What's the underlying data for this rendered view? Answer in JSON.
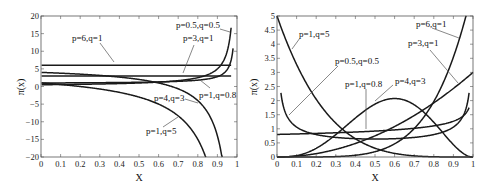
{
  "chart_data": [
    {
      "type": "line",
      "title": "",
      "xlabel": "X",
      "ylabel": "π(x)",
      "xlim": [
        0,
        1
      ],
      "ylim": [
        -20,
        20
      ],
      "xticks": [
        "0",
        "0.1",
        "0.2",
        "0.3",
        "0.4",
        "0.5",
        "0.6",
        "0.7",
        "0.8",
        "0.9",
        "1"
      ],
      "yticks": [
        "20",
        "15",
        "10",
        "5",
        "0",
        "-5",
        "-10",
        "-15",
        "-20"
      ],
      "grid": false,
      "series": [
        {
          "name": "p=6,q=1",
          "p": 6,
          "q": 1,
          "x": [
            0,
            0.5,
            0.97
          ],
          "values": [
            6,
            6,
            6
          ]
        },
        {
          "name": "p=3,q=1",
          "p": 3,
          "q": 1,
          "x": [
            0,
            0.5,
            0.97
          ],
          "values": [
            3,
            3,
            3
          ]
        },
        {
          "name": "p=0.5,q=0.5",
          "p": 0.5,
          "q": 0.5,
          "x": [
            0,
            0.5,
            0.8,
            0.9,
            0.95,
            0.97
          ],
          "values": [
            0.5,
            1,
            2.5,
            5,
            10,
            16.7
          ]
        },
        {
          "name": "p=1,q=0.8",
          "p": 1,
          "q": 0.8,
          "x": [
            0,
            0.5,
            0.8,
            0.9,
            0.95,
            0.98
          ],
          "values": [
            1,
            1.2,
            1.8,
            2.8,
            4.8,
            10.8
          ]
        },
        {
          "name": "p=4,q=3",
          "p": 4,
          "q": 3,
          "x": [
            0,
            0.5,
            0.7,
            0.8,
            0.9,
            0.92
          ],
          "values": [
            4,
            2,
            -0.7,
            -4,
            -14,
            -19
          ]
        },
        {
          "name": "p=1,q=5",
          "p": 1,
          "q": 5,
          "x": [
            0,
            0.3,
            0.5,
            0.7,
            0.8,
            0.84
          ],
          "values": [
            1,
            -0.7,
            -3,
            -8.3,
            -15,
            -20
          ]
        }
      ]
    },
    {
      "type": "line",
      "title": "",
      "xlabel": "X",
      "ylabel": "π(x)",
      "xlim": [
        0,
        1
      ],
      "ylim": [
        0,
        5
      ],
      "xticks": [
        "0",
        "0.1",
        "0.2",
        "0.3",
        "0.4",
        "0.5",
        "0.6",
        "0.7",
        "0.8",
        "0.9",
        "1"
      ],
      "yticks": [
        "5",
        "4.5",
        "4",
        "3.5",
        "3",
        "2.5",
        "2",
        "1.5",
        "1",
        "0.5",
        "0"
      ],
      "grid": false,
      "series": [
        {
          "name": "p=1,q=5",
          "p": 1,
          "q": 5,
          "x": [
            0,
            0.1,
            0.2,
            0.3,
            0.5,
            0.8,
            1
          ],
          "values": [
            5,
            3.28,
            2.05,
            1.2,
            0.31,
            0.01,
            0
          ]
        },
        {
          "name": "p=6,q=1",
          "p": 6,
          "q": 1,
          "x": [
            0,
            0.5,
            0.7,
            0.8,
            0.9,
            0.97
          ],
          "values": [
            0,
            0.19,
            1.01,
            1.97,
            3.54,
            5
          ]
        },
        {
          "name": "p=3,q=1",
          "p": 3,
          "q": 1,
          "x": [
            0,
            0.3,
            0.5,
            0.7,
            0.9,
            1
          ],
          "values": [
            0,
            0.27,
            0.75,
            1.47,
            2.43,
            3
          ]
        },
        {
          "name": "p=0.5,q=0.5",
          "p": 0.5,
          "q": 0.5,
          "x": [
            0.02,
            0.05,
            0.2,
            0.5,
            0.8,
            0.95,
            0.98
          ],
          "values": [
            2.27,
            1.46,
            0.8,
            0.64,
            0.8,
            1.46,
            2.27
          ]
        },
        {
          "name": "p=1,q=0.8",
          "p": 1,
          "q": 0.8,
          "x": [
            0,
            0.3,
            0.5,
            0.8,
            0.9,
            0.98
          ],
          "values": [
            0.8,
            0.86,
            0.92,
            1.1,
            1.27,
            1.74
          ]
        },
        {
          "name": "p=4,q=3",
          "p": 4,
          "q": 3,
          "x": [
            0,
            0.2,
            0.4,
            0.6,
            0.8,
            1
          ],
          "values": [
            0,
            0.31,
            1.38,
            2.07,
            1.23,
            0
          ]
        }
      ]
    }
  ],
  "labels": {
    "left": {
      "p6q1": "p=6,q=1",
      "p3q1": "p=3,q=1",
      "p05q05": "p=0.5,q=0.5",
      "p1q08": "p=1,q=0.8",
      "p4q3": "p=4,q=3",
      "p1q5": "p=1,q=5",
      "xlabel": "X",
      "ylabel": "π(x)"
    },
    "right": {
      "p1q5": "p=1,q=5",
      "p6q1": "p=6,q=1",
      "p3q1": "p=3,q=1",
      "p05q05": "p=0.5,q=0.5",
      "p1q08": "p=1,q=0.8",
      "p4q3": "p=4,q=3",
      "xlabel": "X",
      "ylabel": "π(x)"
    }
  }
}
